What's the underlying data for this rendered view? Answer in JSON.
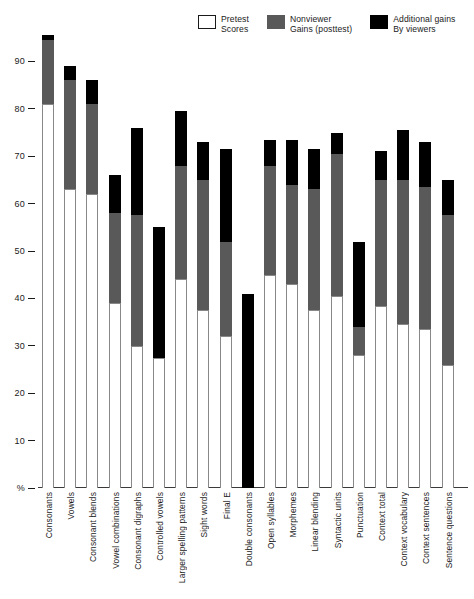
{
  "legend": {
    "items": [
      {
        "label_line1": "Pretest",
        "label_line2": "Scores",
        "swatch": "white-swatch-icon",
        "color": "#ffffff"
      },
      {
        "label_line1": "Nonviewer",
        "label_line2": "Gains (posttest)",
        "swatch": "gray-swatch-icon",
        "color": "#595959"
      },
      {
        "label_line1": "Additional gains",
        "label_line2": "By viewers",
        "swatch": "black-swatch-icon",
        "color": "#000000"
      }
    ]
  },
  "axis": {
    "y_unit_label": "%",
    "y_ticks": [
      "90",
      "80",
      "70",
      "60",
      "50",
      "40",
      "30",
      "20",
      "10"
    ]
  },
  "chart_data": {
    "type": "bar",
    "title": "",
    "subtitle": "",
    "xlabel": "",
    "ylabel": "%",
    "ylim": [
      0,
      100
    ],
    "grid": false,
    "stacked": true,
    "legend_position": "top-right",
    "categories": [
      "Consonants",
      "Vowels",
      "Consonant blends",
      "Vowel combinations",
      "Consonant digraphs",
      "Controlled vowels",
      "Larger spelling patterns",
      "Sight words",
      "Final E",
      "Double consonants",
      "Open syllables",
      "Morphemes",
      "Linear blending",
      "Syntactic units",
      "Punctuation",
      "Context total",
      "Context vocabulary",
      "Context sentences",
      "Sentence questions"
    ],
    "series": [
      {
        "name": "Pretest Scores",
        "color": "#ffffff",
        "values": [
          81,
          63,
          62,
          39,
          30,
          27.5,
          44,
          37.5,
          32,
          0,
          45,
          43,
          37.5,
          40.5,
          28,
          38.5,
          34.5,
          33.5,
          26
        ]
      },
      {
        "name": "Nonviewer Gains (posttest)",
        "color": "#595959",
        "values": [
          13.5,
          23,
          19,
          19,
          27.5,
          0,
          24,
          27.5,
          20,
          0,
          23,
          21,
          25.5,
          30,
          6,
          26.5,
          30.5,
          30,
          31.5
        ]
      },
      {
        "name": "Additional gains By viewers",
        "color": "#000000",
        "values": [
          1,
          3,
          5,
          8,
          18.5,
          27.5,
          11.5,
          8,
          19.5,
          41,
          5.5,
          9.5,
          8.5,
          4.5,
          18,
          6,
          10.5,
          9.5,
          7.5
        ]
      }
    ],
    "totals": [
      95.5,
      89,
      86,
      66,
      76,
      55,
      79.5,
      73,
      71.5,
      41,
      73.5,
      73.5,
      71.5,
      75,
      52,
      71,
      75.5,
      73,
      65
    ]
  }
}
